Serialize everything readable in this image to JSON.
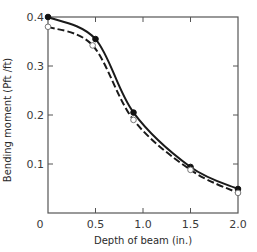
{
  "chart_data": {
    "type": "line",
    "title": "",
    "xlabel": "Depth of beam (in.)",
    "ylabel": "Bending moment (Pft /ft)",
    "xlim": [
      0,
      2.0
    ],
    "ylim": [
      0,
      0.4
    ],
    "x_ticks": [
      "0",
      "0.5",
      "1.0",
      "1.5",
      "2.0"
    ],
    "y_ticks": [
      "0.1",
      "0.2",
      "0.3",
      "0.4"
    ],
    "grid": false,
    "legend": null,
    "series": [
      {
        "name": "solid (filled markers)",
        "style": "solid",
        "marker": "filled-circle",
        "x": [
          0,
          0.5,
          0.9,
          1.5,
          2.0
        ],
        "values": [
          0.4,
          0.355,
          0.205,
          0.094,
          0.049
        ]
      },
      {
        "name": "dashed (open markers)",
        "style": "dashed",
        "marker": "open-circle",
        "x": [
          0,
          0.47,
          0.9,
          1.5,
          2.0
        ],
        "values": [
          0.38,
          0.342,
          0.19,
          0.088,
          0.041
        ]
      }
    ]
  },
  "colors": {
    "line": "#1a1a1a",
    "axis": "#555555"
  }
}
